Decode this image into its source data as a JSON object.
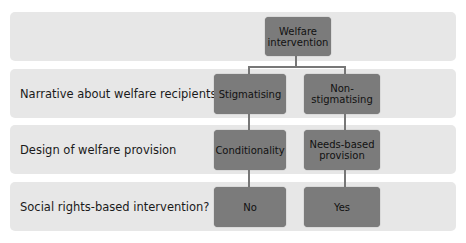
{
  "colors": {
    "band": "#e7e7e7",
    "node": "#7b7b7b",
    "connector": "#777777",
    "text": "#1a1a1a"
  },
  "rows": [
    {
      "label": ""
    },
    {
      "label": "Narrative about welfare recipients"
    },
    {
      "label": "Design of welfare provision"
    },
    {
      "label": "Social rights-based intervention?"
    }
  ],
  "nodes": {
    "root": {
      "line1": "Welfare",
      "line2": "intervention"
    },
    "left_1": {
      "line1": "Stigmatising",
      "line2": ""
    },
    "right_1": {
      "line1": "Non-",
      "line2": "stigmatising"
    },
    "left_2": {
      "line1": "Conditionality",
      "line2": ""
    },
    "right_2": {
      "line1": "Needs-based",
      "line2": "provision"
    },
    "left_3": {
      "line1": "No",
      "line2": ""
    },
    "right_3": {
      "line1": "Yes",
      "line2": ""
    }
  }
}
